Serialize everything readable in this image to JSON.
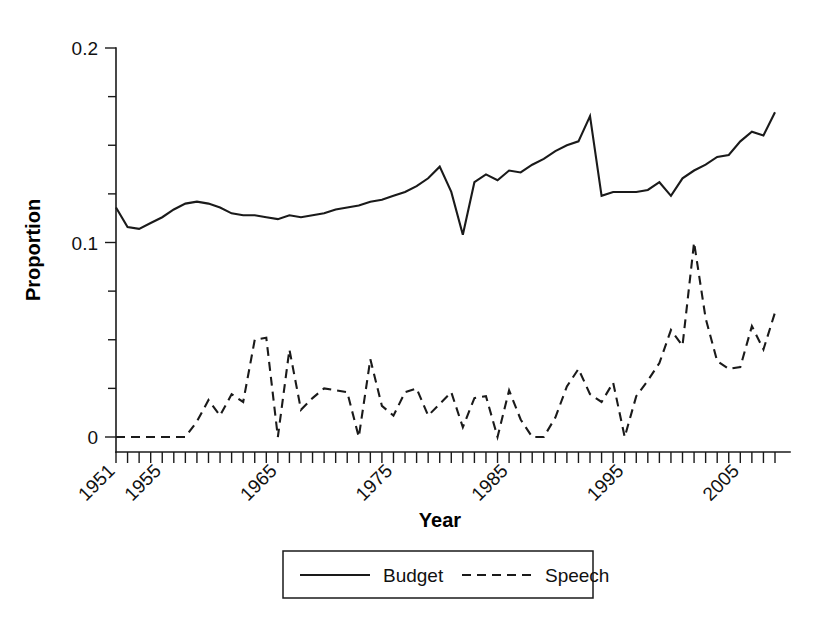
{
  "chart_data": {
    "type": "line",
    "title": "",
    "xlabel": "Year",
    "ylabel": "Proportion",
    "xlim": [
      1951,
      2008
    ],
    "ylim": [
      0,
      0.2
    ],
    "grid": false,
    "legend_position": "bottom",
    "y_ticks_major": [
      0,
      0.1,
      0.2
    ],
    "y_tick_labels": [
      "0",
      "0.1",
      "0.2"
    ],
    "y_ticks_minor": [
      0.025,
      0.05,
      0.075,
      0.125,
      0.15,
      0.175
    ],
    "x_tick_labels": [
      "1951",
      "1955",
      "1965",
      "1975",
      "1985",
      "1995",
      "2005"
    ],
    "x_tick_label_years": [
      1951,
      1955,
      1965,
      1975,
      1985,
      1995,
      2005
    ],
    "x_tick_rotation_deg": -45,
    "x": [
      1951,
      1952,
      1953,
      1954,
      1955,
      1956,
      1957,
      1958,
      1959,
      1960,
      1961,
      1962,
      1963,
      1964,
      1965,
      1966,
      1967,
      1968,
      1969,
      1970,
      1971,
      1972,
      1973,
      1974,
      1975,
      1976,
      1977,
      1978,
      1979,
      1980,
      1981,
      1982,
      1983,
      1984,
      1985,
      1986,
      1987,
      1988,
      1989,
      1990,
      1991,
      1992,
      1993,
      1994,
      1995,
      1996,
      1997,
      1998,
      1999,
      2000,
      2001,
      2002,
      2003,
      2004,
      2005,
      2006,
      2007,
      2008
    ],
    "series": [
      {
        "name": "Budget",
        "style": "solid",
        "color": "#1a1a1a",
        "values": [
          0.118,
          0.108,
          0.107,
          0.11,
          0.113,
          0.117,
          0.12,
          0.121,
          0.12,
          0.118,
          0.115,
          0.114,
          0.114,
          0.113,
          0.112,
          0.114,
          0.113,
          0.114,
          0.115,
          0.117,
          0.118,
          0.119,
          0.121,
          0.122,
          0.124,
          0.126,
          0.129,
          0.133,
          0.139,
          0.126,
          0.104,
          0.131,
          0.135,
          0.132,
          0.137,
          0.136,
          0.14,
          0.143,
          0.147,
          0.15,
          0.152,
          0.165,
          0.124,
          0.126,
          0.126,
          0.126,
          0.127,
          0.131,
          0.124,
          0.133,
          0.137,
          0.14,
          0.144,
          0.145,
          0.152,
          0.157,
          0.155,
          0.167
        ]
      },
      {
        "name": "Speech",
        "style": "dashed",
        "color": "#1a1a1a",
        "values": [
          0.0,
          0.0,
          0.0,
          0.0,
          0.0,
          0.0,
          0.0,
          0.008,
          0.019,
          0.011,
          0.022,
          0.018,
          0.05,
          0.051,
          0.0,
          0.045,
          0.014,
          0.02,
          0.025,
          0.024,
          0.023,
          0.0,
          0.04,
          0.016,
          0.011,
          0.023,
          0.025,
          0.011,
          0.017,
          0.023,
          0.005,
          0.02,
          0.021,
          0.0,
          0.024,
          0.009,
          0.0,
          0.0,
          0.01,
          0.026,
          0.035,
          0.022,
          0.018,
          0.028,
          0.0,
          0.021,
          0.029,
          0.038,
          0.055,
          0.047,
          0.1,
          0.061,
          0.039,
          0.035,
          0.036,
          0.057,
          0.045,
          0.064
        ]
      }
    ]
  },
  "legend": {
    "entries": [
      {
        "label": "Budget",
        "style": "solid"
      },
      {
        "label": "Speech",
        "style": "dashed"
      }
    ]
  }
}
